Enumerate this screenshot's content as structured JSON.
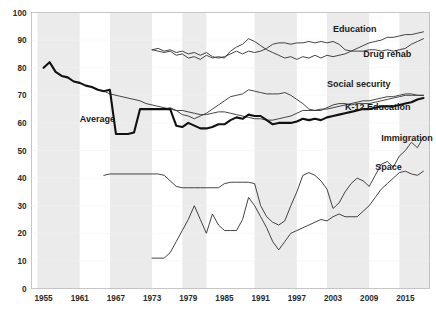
{
  "chart_data": {
    "type": "line",
    "title": "",
    "subtitle": "",
    "xlabel": "",
    "ylabel": "",
    "xlim": [
      1953,
      2019
    ],
    "ylim": [
      0,
      100
    ],
    "ytick_step": 10,
    "grid": false,
    "legend_position": "inline-right-of-line-end",
    "x_ticks": [
      "1955",
      "1961",
      "1967",
      "1973",
      "1979",
      "1985",
      "1991",
      "1997",
      "2003",
      "2009",
      "2015"
    ],
    "y_ticks": [
      "0",
      "10",
      "20",
      "30",
      "40",
      "50",
      "60",
      "70",
      "80",
      "90",
      "100"
    ],
    "shaded_bands": [
      {
        "start": 1954,
        "end": 1961
      },
      {
        "start": 1966,
        "end": 1973
      },
      {
        "start": 1978,
        "end": 1982
      },
      {
        "start": 1990,
        "end": 1997
      },
      {
        "start": 2002,
        "end": 2009
      },
      {
        "start": 2014,
        "end": 2019
      }
    ],
    "series": [
      {
        "name": "Education",
        "label": "Education",
        "style": "thin",
        "label_x": 2003,
        "label_y": 93,
        "x": [
          1973,
          1974,
          1975,
          1976,
          1977,
          1978,
          1979,
          1980,
          1981,
          1982,
          1983,
          1984,
          1985,
          1986,
          1987,
          1988,
          1989,
          1990,
          1991,
          1992,
          1993,
          1994,
          1995,
          1996,
          1997,
          1998,
          1999,
          2000,
          2001,
          2002,
          2003,
          2004,
          2005,
          2006,
          2007,
          2008,
          2009,
          2010,
          2011,
          2012,
          2013,
          2014,
          2015,
          2016,
          2017,
          2018
        ],
        "y": [
          86.5,
          87,
          86,
          86.5,
          85.5,
          86,
          85,
          85.5,
          84.5,
          85.5,
          84,
          83.5,
          84,
          85,
          86,
          85,
          86,
          85.5,
          86,
          87,
          88.5,
          89,
          89,
          88.5,
          89,
          89,
          89.5,
          89,
          89.5,
          89,
          89.5,
          88.5,
          86.5,
          86,
          86,
          86,
          86.5,
          86.5,
          86,
          86.5,
          86,
          86.5,
          87,
          88.5,
          89.5,
          90.5
        ]
      },
      {
        "name": "Drug rehab",
        "label": "Drug rehab",
        "style": "thin",
        "label_x": 2008,
        "label_y": 84,
        "x": [
          1973,
          1974,
          1975,
          1976,
          1977,
          1978,
          1979,
          1980,
          1981,
          1982,
          1983,
          1984,
          1985,
          1986,
          1987,
          1988,
          1989,
          1990,
          1991,
          1992,
          1993,
          1994,
          1995,
          1996,
          1997,
          1998,
          1999,
          2000,
          2001,
          2002,
          2003,
          2004,
          2005,
          2006,
          2007,
          2008,
          2009,
          2010,
          2011,
          2012,
          2013,
          2014,
          2015,
          2016,
          2017,
          2018
        ],
        "y": [
          86.5,
          86,
          85.5,
          86,
          84.5,
          85,
          83.5,
          84,
          83,
          84.5,
          83.5,
          84,
          83.5,
          86,
          87.5,
          88.5,
          90.5,
          89.5,
          88,
          86.5,
          85.5,
          84.5,
          83.5,
          84,
          83,
          84,
          83.5,
          84.5,
          83.5,
          84.5,
          84,
          84.5,
          85,
          86,
          87,
          88,
          89,
          89.5,
          90,
          91,
          91,
          91.5,
          92,
          92,
          92.5,
          93
        ]
      },
      {
        "name": "Social security",
        "label": "Social security",
        "style": "thin",
        "label_x": 2002,
        "label_y": 73,
        "x": [
          1965,
          1966,
          1967,
          1968,
          1969,
          1970,
          1971,
          1972,
          1973,
          1974,
          1975,
          1976,
          1977,
          1978,
          1979,
          1980,
          1981,
          1982,
          1983,
          1984,
          1985,
          1986,
          1987,
          1988,
          1989,
          1990,
          1991,
          1992,
          1993,
          1994,
          1995,
          1996,
          1997,
          1998,
          1999,
          2000,
          2001,
          2002,
          2003,
          2004,
          2005,
          2006,
          2007,
          2008,
          2009,
          2010,
          2011,
          2012,
          2013,
          2014,
          2015,
          2016,
          2017,
          2018
        ],
        "y": [
          71.5,
          70.5,
          70,
          69.5,
          69,
          68.5,
          68,
          67,
          66.5,
          66,
          65.5,
          65,
          64.5,
          64.5,
          64,
          63.5,
          63,
          63,
          63.5,
          64,
          64,
          63.5,
          63,
          62.5,
          62,
          61.5,
          61.5,
          61,
          61,
          61.5,
          62,
          62.5,
          63.5,
          64.5,
          64.5,
          64.5,
          65,
          65,
          65.5,
          66,
          66.5,
          67,
          67.5,
          68,
          68,
          68.5,
          69,
          69.5,
          69.5,
          70,
          70.5,
          70.5,
          70,
          70
        ]
      },
      {
        "name": "K-12 Education",
        "label": "K-12 Education",
        "style": "thin",
        "label_x": 2005,
        "label_y": 64.5,
        "x": [
          1973,
          1974,
          1975,
          1976,
          1977,
          1978,
          1979,
          1980,
          1981,
          1982,
          1983,
          1984,
          1985,
          1986,
          1987,
          1988,
          1989,
          1990,
          1991,
          1992,
          1993,
          1994,
          1995,
          1996,
          1997,
          1998,
          1999,
          2000,
          2001,
          2002,
          2003,
          2004,
          2005,
          2006,
          2007,
          2008,
          2009,
          2010,
          2011,
          2012,
          2013,
          2014,
          2015,
          2016,
          2017,
          2018
        ],
        "y": [
          65,
          65,
          65,
          65.5,
          64.5,
          63,
          62.5,
          61.5,
          62.5,
          63.5,
          65,
          66.5,
          68,
          69.5,
          70,
          70.5,
          72,
          71.5,
          71,
          70.5,
          70.5,
          70.5,
          71,
          70,
          68.5,
          67,
          65,
          64.5,
          64.5,
          65.5,
          66.5,
          67,
          67,
          66.5,
          67,
          67,
          67,
          67.5,
          68,
          68.5,
          69,
          69.5,
          70,
          70,
          70,
          70
        ]
      },
      {
        "name": "Average",
        "label": "Average",
        "style": "thick",
        "label_x": 1961,
        "label_y": 60.5,
        "x": [
          1955,
          1956,
          1957,
          1958,
          1959,
          1960,
          1961,
          1962,
          1963,
          1964,
          1965,
          1966,
          1967,
          1968,
          1969,
          1970,
          1971,
          1972,
          1973,
          1974,
          1975,
          1976,
          1977,
          1978,
          1979,
          1980,
          1981,
          1982,
          1983,
          1984,
          1985,
          1986,
          1987,
          1988,
          1989,
          1990,
          1991,
          1992,
          1993,
          1994,
          1995,
          1996,
          1997,
          1998,
          1999,
          2000,
          2001,
          2002,
          2003,
          2004,
          2005,
          2006,
          2007,
          2008,
          2009,
          2010,
          2011,
          2012,
          2013,
          2014,
          2015,
          2016,
          2017,
          2018
        ],
        "y": [
          80,
          82,
          78.5,
          77,
          76.5,
          75,
          74.5,
          73.5,
          73,
          72,
          71.5,
          72,
          56,
          56,
          56,
          56.5,
          65,
          65,
          65,
          65,
          65,
          65,
          59,
          58.5,
          60,
          59,
          58,
          58,
          58.5,
          59.5,
          59.5,
          61,
          62,
          61.5,
          63,
          62.5,
          62.5,
          61,
          59.5,
          60,
          60,
          60,
          60.5,
          61.5,
          61,
          61.5,
          61,
          62,
          62.5,
          63,
          63.5,
          64,
          64.5,
          65,
          65,
          65.5,
          66,
          66,
          66,
          66.5,
          67,
          67.5,
          68.5,
          69
        ]
      },
      {
        "name": "Immigration",
        "label": "Immigration",
        "style": "thin",
        "label_x": 2011,
        "label_y": 53.5,
        "x": [
          1965,
          1966,
          1967,
          1968,
          1969,
          1970,
          1971,
          1972,
          1973,
          1974,
          1975,
          1976,
          1977,
          1978,
          1979,
          1980,
          1981,
          1982,
          1983,
          1984,
          1985,
          1986,
          1987,
          1988,
          1989,
          1990,
          1991,
          1992,
          1993,
          1994,
          1995,
          1996,
          1997,
          1998,
          1999,
          2000,
          2001,
          2002,
          2003,
          2004,
          2005,
          2006,
          2007,
          2008,
          2009,
          2010,
          2011,
          2012,
          2013,
          2014,
          2015,
          2016,
          2017,
          2018
        ],
        "y": [
          41,
          41.5,
          41.5,
          41.5,
          41.5,
          41.5,
          41.5,
          41.5,
          41.5,
          41.5,
          41,
          39,
          37,
          36.5,
          36.5,
          36.5,
          36.5,
          36.5,
          36.5,
          36.5,
          38,
          38.5,
          38.5,
          38.5,
          38.5,
          38,
          30,
          26,
          24,
          23,
          24.5,
          30,
          35,
          41,
          42,
          41,
          39,
          36,
          29,
          31,
          35,
          38,
          40,
          39,
          37,
          41,
          45,
          46,
          44,
          48,
          50,
          53,
          51,
          55
        ]
      },
      {
        "name": "Space",
        "label": "Space",
        "style": "thin",
        "label_x": 2010,
        "label_y": 43,
        "x": [
          1973,
          1974,
          1975,
          1976,
          1977,
          1978,
          1979,
          1980,
          1981,
          1982,
          1983,
          1984,
          1985,
          1986,
          1987,
          1988,
          1989,
          1990,
          1991,
          1992,
          1993,
          1994,
          1995,
          1996,
          1997,
          1998,
          1999,
          2000,
          2001,
          2002,
          2003,
          2004,
          2005,
          2006,
          2007,
          2008,
          2009,
          2010,
          2011,
          2012,
          2013,
          2014,
          2015,
          2016,
          2017,
          2018
        ],
        "y": [
          11,
          11,
          11,
          13,
          17,
          21,
          25,
          30,
          25,
          20,
          27,
          23,
          21,
          21,
          21,
          25,
          33,
          30,
          26,
          22,
          17,
          14,
          17,
          20,
          21,
          22,
          23,
          24,
          25,
          24.5,
          26,
          27,
          26,
          26,
          26,
          28,
          30,
          33,
          36,
          38,
          40,
          42,
          42.5,
          41.5,
          41,
          42.5
        ]
      }
    ]
  }
}
